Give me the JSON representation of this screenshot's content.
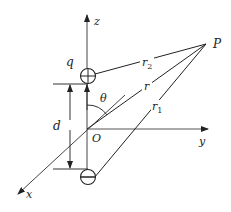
{
  "diagram": {
    "labels": {
      "z_axis": "z",
      "y_axis": "y",
      "x_axis": "x",
      "origin": "O",
      "point": "P",
      "charge": "q",
      "separation": "d",
      "angle": "θ",
      "r": "r",
      "r1": "r",
      "r1_sub": "1",
      "r2": "r",
      "r2_sub": "2"
    },
    "charges": [
      {
        "sign": "+",
        "symbol": "plus-charge"
      },
      {
        "sign": "−",
        "symbol": "minus-charge"
      }
    ],
    "colors": {
      "line": "#222222",
      "axis": "#555555",
      "background": "#ffffff"
    }
  }
}
